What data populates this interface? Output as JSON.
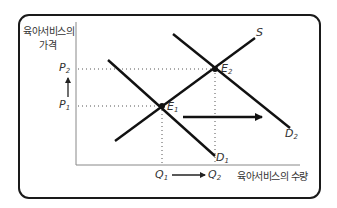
{
  "diagram": {
    "title_ylabel_line1": "육아서비스의",
    "title_ylabel_line2": "가격",
    "xlabel": "육아서비스의 수량",
    "curves": {
      "supply": {
        "label": "S"
      },
      "demand_initial": {
        "label": "D",
        "sub": "1"
      },
      "demand_shifted": {
        "label": "D",
        "sub": "2"
      }
    },
    "equilibria": {
      "e1": {
        "label": "E",
        "sub": "1"
      },
      "e2": {
        "label": "E",
        "sub": "2"
      }
    },
    "price_ticks": {
      "p1": {
        "label": "P",
        "sub": "1"
      },
      "p2": {
        "label": "P",
        "sub": "2"
      }
    },
    "quantity_ticks": {
      "q1": {
        "label": "Q",
        "sub": "1"
      },
      "q2": {
        "label": "Q",
        "sub": "2"
      }
    },
    "colors": {
      "line": "#111111",
      "axis": "#888888",
      "guide": "#555555",
      "frame": "#1a1a1a"
    }
  }
}
